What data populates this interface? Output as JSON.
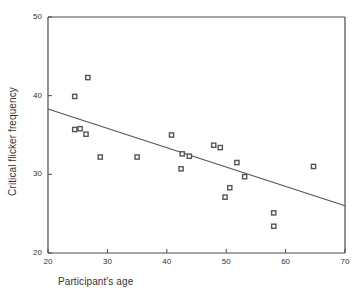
{
  "chart_data": {
    "type": "scatter",
    "title": "",
    "xlabel": "Participant's age",
    "ylabel": "Critical flicker frequency",
    "xlim": [
      20,
      70
    ],
    "ylim": [
      20,
      50
    ],
    "xticks": [
      20,
      30,
      40,
      50,
      60,
      70
    ],
    "yticks": [
      20,
      30,
      40,
      50
    ],
    "grid": false,
    "legend": null,
    "marker": "square",
    "marker_color": "#555555",
    "line_color": "#555555",
    "points": [
      {
        "x": 24.5,
        "y": 39.9
      },
      {
        "x": 26.7,
        "y": 42.3
      },
      {
        "x": 24.5,
        "y": 35.7
      },
      {
        "x": 25.4,
        "y": 35.8
      },
      {
        "x": 26.4,
        "y": 35.1
      },
      {
        "x": 28.8,
        "y": 32.2
      },
      {
        "x": 35.0,
        "y": 32.2
      },
      {
        "x": 40.8,
        "y": 35.0
      },
      {
        "x": 42.6,
        "y": 32.6
      },
      {
        "x": 42.4,
        "y": 30.7
      },
      {
        "x": 43.8,
        "y": 32.3
      },
      {
        "x": 47.9,
        "y": 33.7
      },
      {
        "x": 49.0,
        "y": 33.4
      },
      {
        "x": 49.8,
        "y": 27.1
      },
      {
        "x": 50.6,
        "y": 28.3
      },
      {
        "x": 51.8,
        "y": 31.5
      },
      {
        "x": 53.1,
        "y": 29.7
      },
      {
        "x": 58.0,
        "y": 25.1
      },
      {
        "x": 58.0,
        "y": 23.4
      },
      {
        "x": 64.7,
        "y": 31.0
      }
    ],
    "trendline": {
      "x_start": 20,
      "y_start": 38.3,
      "x_end": 70,
      "y_end": 26.0
    }
  },
  "axes": {
    "x_tick_labels": [
      "20",
      "30",
      "40",
      "50",
      "60",
      "70"
    ],
    "y_tick_labels": [
      "50",
      "40",
      "30",
      "20"
    ],
    "x_axis_title": "Participant's age",
    "y_axis_title": "Critical flicker frequency"
  }
}
